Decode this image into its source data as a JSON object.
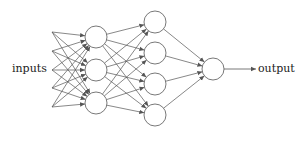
{
  "diagram": {
    "type": "feedforward-neural-network",
    "labels": {
      "inputs": "inputs",
      "output": "output"
    },
    "colors": {
      "stroke": "#555555",
      "node_fill": "#ffffff",
      "text": "#222222"
    },
    "input_points": [
      [
        52,
        32
      ],
      [
        52,
        51
      ],
      [
        52,
        70
      ],
      [
        52,
        88
      ],
      [
        52,
        107
      ]
    ],
    "layers": [
      {
        "name": "hidden-1",
        "x": 96,
        "ys": [
          37,
          70,
          103
        ],
        "r": 11
      },
      {
        "name": "hidden-2",
        "x": 155,
        "ys": [
          22,
          53,
          84,
          115
        ],
        "r": 11
      },
      {
        "name": "output",
        "x": 213,
        "ys": [
          69
        ],
        "r": 11
      }
    ],
    "output_arrow": {
      "x1": 224,
      "y1": 69,
      "x2": 256,
      "y2": 69
    }
  }
}
